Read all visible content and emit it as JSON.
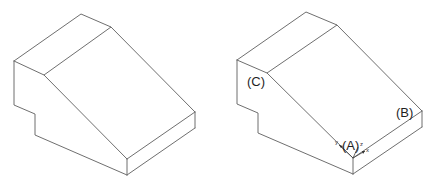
{
  "figures": [
    {
      "id": "left",
      "description": "Isometric stepped wedge block (unlabeled)"
    },
    {
      "id": "right",
      "description": "Isometric stepped wedge block with labeled points",
      "labels": {
        "A": "(A)",
        "B": "(B)",
        "C": "(C)"
      },
      "axes": {
        "x": "x",
        "y": "y",
        "z": "z"
      }
    }
  ],
  "colors": {
    "edge": "#6f6f6f",
    "text": "#1f1f1f"
  }
}
